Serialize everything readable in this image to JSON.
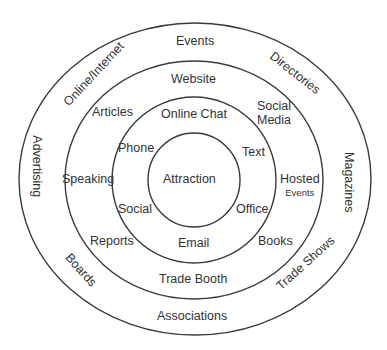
{
  "diagram": {
    "type": "concentric-rings",
    "colors": {
      "stroke": "#3a3a3a",
      "text": "#333333",
      "background": "#ffffff"
    },
    "core": {
      "label": "Attraction"
    },
    "ring1": {
      "labels": {
        "top": "Online Chat",
        "upper_left": "Phone",
        "upper_right": "Text",
        "lower_left": "Social",
        "lower_right": "Office",
        "bottom": "Email"
      }
    },
    "ring2": {
      "labels": {
        "top": "Website",
        "upper_left": "Articles",
        "upper_right_line1": "Social",
        "upper_right_line2": "Media",
        "left": "Speaking",
        "right_line1": "Hosted",
        "right_line2": "Events",
        "lower_left": "Reports",
        "lower_right": "Books",
        "bottom": "Trade Booth"
      }
    },
    "ring3": {
      "labels": {
        "top": "Events",
        "upper_left": "Online/Internet",
        "upper_right": "Directories",
        "left": "Advertising",
        "right": "Magazines",
        "lower_left": "Boards",
        "lower_right": "Trade Shows",
        "bottom": "Associations"
      }
    }
  }
}
